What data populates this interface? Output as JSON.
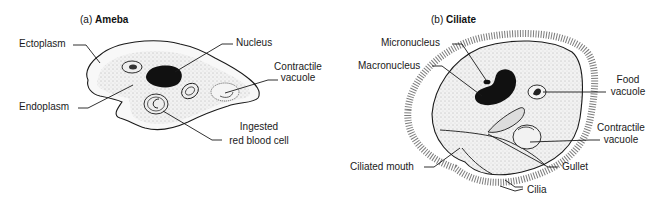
{
  "panels": [
    {
      "id": "a",
      "title_prefix": "(a)",
      "title": "Ameba",
      "labels": {
        "ectoplasm": "Ectoplasm",
        "endoplasm": "Endoplasm",
        "nucleus": "Nucleus",
        "contractile_vacuole_1": "Contractile",
        "contractile_vacuole_2": "vacuole",
        "ingested_1": "Ingested",
        "ingested_2": "red blood cell"
      }
    },
    {
      "id": "b",
      "title_prefix": "(b)",
      "title": "Ciliate",
      "labels": {
        "micronucleus": "Micronucleus",
        "macronucleus": "Macronucleus",
        "food_vacuole_1": "Food",
        "food_vacuole_2": "vacuole",
        "contractile_vacuole_1": "Contractile",
        "contractile_vacuole_2": "vacuole",
        "ciliated_mouth": "Ciliated mouth",
        "gullet": "Gullet",
        "cilia": "Cilia"
      }
    }
  ],
  "colors": {
    "line": "#1a1a1a",
    "cytoplasm": "#e9e9e9",
    "ectoplasm": "#f6f6f6",
    "nucleus": "#111111"
  }
}
